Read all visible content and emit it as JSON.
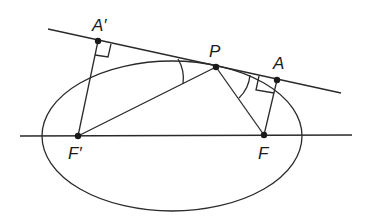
{
  "diagram": {
    "labels": {
      "A_prime": "A′",
      "P": "P",
      "A": "A",
      "F_prime": "F′",
      "F": "F"
    },
    "colors": {
      "stroke": "#2a2a2a",
      "background": "#ffffff"
    }
  }
}
